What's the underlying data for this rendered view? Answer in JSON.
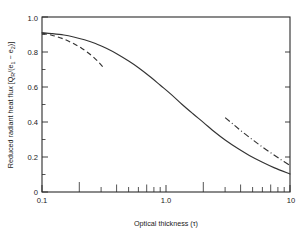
{
  "chart_data": {
    "type": "line",
    "title": "",
    "xlabel": "Optical thickness (τ)",
    "ylabel": "Reduced radiant heat flux [Q",
    "ylabel_parts": {
      "lead": "Reduced radiant heat flux [Q",
      "sub_r": "R",
      "mid": "/(e",
      "sub_1": "1",
      "minus": " − e",
      "sub_2": "2",
      "tail": ")]"
    },
    "xscale": "log",
    "yscale": "linear",
    "xlim": [
      0.1,
      10
    ],
    "ylim": [
      0,
      1.0
    ],
    "grid": false,
    "legend": "none",
    "xticks": [
      0.1,
      1.0,
      10
    ],
    "xtick_labels": [
      "0.1",
      "1.0",
      "10"
    ],
    "xminor_ticks": [
      0.2,
      0.3,
      0.4,
      0.5,
      0.6,
      0.7,
      0.8,
      0.9,
      2,
      3,
      4,
      5,
      6,
      7,
      8,
      9
    ],
    "yticks": [
      0,
      0.2,
      0.4,
      0.6,
      0.8,
      1.0
    ],
    "ytick_labels": [
      "0",
      "0.2",
      "0.4",
      "0.6",
      "0.8",
      "1.0"
    ],
    "yminor_ticks": [
      0.1,
      0.3,
      0.5,
      0.7,
      0.9
    ],
    "series": [
      {
        "name": "solid-curve",
        "style": "solid",
        "color": "#333333",
        "x": [
          0.1,
          0.12,
          0.15,
          0.18,
          0.22,
          0.27,
          0.33,
          0.4,
          0.5,
          0.6,
          0.75,
          0.9,
          1.1,
          1.35,
          1.65,
          2.0,
          2.5,
          3.0,
          3.8,
          4.7,
          6.0,
          7.5,
          10.0
        ],
        "y": [
          0.91,
          0.905,
          0.897,
          0.886,
          0.87,
          0.849,
          0.821,
          0.79,
          0.748,
          0.71,
          0.657,
          0.61,
          0.558,
          0.5,
          0.447,
          0.398,
          0.34,
          0.297,
          0.248,
          0.209,
          0.17,
          0.138,
          0.103
        ]
      },
      {
        "name": "dashed-curve",
        "style": "dashed",
        "color": "#333333",
        "x": [
          0.1,
          0.12,
          0.145,
          0.175,
          0.21,
          0.25,
          0.29,
          0.32
        ],
        "y": [
          0.908,
          0.896,
          0.878,
          0.852,
          0.82,
          0.781,
          0.738,
          0.703
        ]
      },
      {
        "name": "dash-dot-curve",
        "style": "dashdot",
        "color": "#333333",
        "x": [
          3.0,
          3.5,
          4.1,
          4.9,
          5.8,
          7.0,
          8.4,
          10.0
        ],
        "y": [
          0.425,
          0.386,
          0.345,
          0.303,
          0.264,
          0.224,
          0.186,
          0.152
        ]
      }
    ]
  },
  "figure": {
    "background_color": "#ffffff",
    "axis_color": "#2a2a2a"
  }
}
